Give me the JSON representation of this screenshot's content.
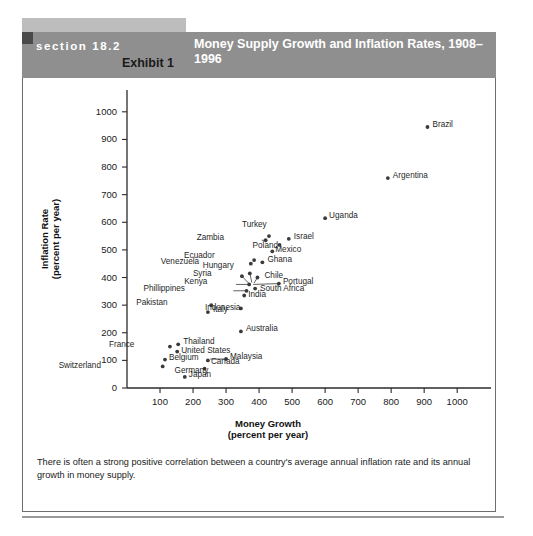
{
  "header": {
    "section_label": "section 18.2",
    "exhibit_label": "Exhibit 1",
    "title": "Money Supply Growth and Inflation Rates, 1908–1996",
    "band_color": "#8f8f8f",
    "block_color": "#bdbdbd",
    "corner_color": "#4a4a4a"
  },
  "caption": {
    "text": "There is often a strong positive correlation between a country's average annual inflation rate and its annual growth in money supply."
  },
  "chart_data": {
    "type": "scatter",
    "title": "Money Supply Growth and Inflation Rates, 1908–1996",
    "xlabel": "Money Growth",
    "xlabel_sub": "(percent per year)",
    "ylabel": "Inflation Rate",
    "ylabel_sub": "(percent per year)",
    "xlim": [
      0,
      1060
    ],
    "ylim": [
      0,
      1050
    ],
    "xticks": [
      100,
      200,
      300,
      400,
      500,
      600,
      700,
      800,
      900,
      1000
    ],
    "yticks": [
      0,
      100,
      200,
      300,
      400,
      500,
      600,
      700,
      800,
      900,
      1000
    ],
    "grid": false,
    "legend": "none",
    "marker_color": "#3a3a3a",
    "points": [
      {
        "name": "Brazil",
        "x": 910,
        "y": 945,
        "label_dx": 5,
        "label_dy": -4
      },
      {
        "name": "Argentina",
        "x": 790,
        "y": 760,
        "label_dx": 5,
        "label_dy": -4
      },
      {
        "name": "Uganda",
        "x": 600,
        "y": 615,
        "label_dx": 4,
        "label_dy": -4
      },
      {
        "name": "Turkey",
        "x": 430,
        "y": 550,
        "label_dx": -8,
        "label_dy": -13
      },
      {
        "name": "Israel",
        "x": 490,
        "y": 540,
        "label_dx": 5,
        "label_dy": -4
      },
      {
        "name": "Zambia",
        "x": 420,
        "y": 535,
        "label_dx": -48,
        "label_dy": -4
      },
      {
        "name": "Poland",
        "x": 462,
        "y": 518,
        "label_dx": -7,
        "label_dy": -1
      },
      {
        "name": "Mexico",
        "x": 440,
        "y": 495,
        "label_dx": 3,
        "label_dy": -3
      },
      {
        "name": "Ecuador",
        "x": 385,
        "y": 463,
        "label_dx": -45,
        "label_dy": -6
      },
      {
        "name": "Ghana",
        "x": 410,
        "y": 455,
        "label_dx": 5,
        "label_dy": -4
      },
      {
        "name": "Venezuela",
        "x": 375,
        "y": 450,
        "label_dx": -58,
        "label_dy": -4
      },
      {
        "name": "Hungary",
        "x": 372,
        "y": 415,
        "label_dx": -22,
        "label_dy": -9
      },
      {
        "name": "Syria",
        "x": 348,
        "y": 405,
        "label_dx": -36,
        "label_dy": -4
      },
      {
        "name": "Chile",
        "x": 395,
        "y": 400,
        "label_dx": 7,
        "label_dy": -4
      },
      {
        "name": "Portugal",
        "x": 460,
        "y": 378,
        "label_dx": 4,
        "label_dy": -4
      },
      {
        "name": "Kenya",
        "x": 370,
        "y": 375,
        "label_dx": -48,
        "label_dy": -4
      },
      {
        "name": "South Africa",
        "x": 388,
        "y": 360,
        "label_dx": 5,
        "label_dy": -2
      },
      {
        "name": "Phillippines",
        "x": 362,
        "y": 352,
        "label_dx": -68,
        "label_dy": -4
      },
      {
        "name": "India",
        "x": 355,
        "y": 335,
        "label_dx": 4,
        "label_dy": -2
      },
      {
        "name": "Pakistan",
        "x": 255,
        "y": 300,
        "label_dx": -50,
        "label_dy": -4
      },
      {
        "name": "Indonesia",
        "x": 345,
        "y": 288,
        "label_dx": -6,
        "label_dy": -2
      },
      {
        "name": "Italy",
        "x": 245,
        "y": 275,
        "label_dx": 5,
        "label_dy": -4
      },
      {
        "name": "Australia",
        "x": 345,
        "y": 205,
        "label_dx": 5,
        "label_dy": -4
      },
      {
        "name": "Thailand",
        "x": 155,
        "y": 158,
        "label_dx": 5,
        "label_dy": -4
      },
      {
        "name": "France",
        "x": 130,
        "y": 150,
        "label_dx": -42,
        "label_dy": -4
      },
      {
        "name": "United States",
        "x": 152,
        "y": 132,
        "label_dx": 4,
        "label_dy": -3
      },
      {
        "name": "Malaysia",
        "x": 300,
        "y": 105,
        "label_dx": 4,
        "label_dy": -4
      },
      {
        "name": "Belgium",
        "x": 115,
        "y": 103,
        "label_dx": 4,
        "label_dy": -4
      },
      {
        "name": "Canada",
        "x": 245,
        "y": 100,
        "label_dx": 3,
        "label_dy": 0
      },
      {
        "name": "Switzerland",
        "x": 108,
        "y": 78,
        "label_dx": -68,
        "label_dy": -2
      },
      {
        "name": "Germany",
        "x": 235,
        "y": 70,
        "label_dx": -2,
        "label_dy": 0
      },
      {
        "name": "Japan",
        "x": 175,
        "y": 40,
        "label_dx": 4,
        "label_dy": -4
      }
    ],
    "leader_lines": [
      {
        "from": "Zambia",
        "x1": 420,
        "y1": 535,
        "x2": 408,
        "y2": 535
      },
      {
        "from": "Syria",
        "x1": 348,
        "y1": 405,
        "x2": 368,
        "y2": 380
      },
      {
        "from": "Kenya",
        "x1": 370,
        "y1": 375,
        "x2": 330,
        "y2": 375
      },
      {
        "from": "Phillippines",
        "x1": 362,
        "y1": 352,
        "x2": 322,
        "y2": 352
      },
      {
        "from": "Portugal",
        "x1": 460,
        "y1": 378,
        "x2": 382,
        "y2": 375
      },
      {
        "from": "Hungary",
        "x1": 372,
        "y1": 415,
        "x2": 378,
        "y2": 382
      },
      {
        "from": "Chile",
        "x1": 395,
        "y1": 400,
        "x2": 385,
        "y2": 380
      },
      {
        "from": "Malaysia",
        "x1": 300,
        "y1": 105,
        "x2": 252,
        "y2": 105
      }
    ]
  }
}
